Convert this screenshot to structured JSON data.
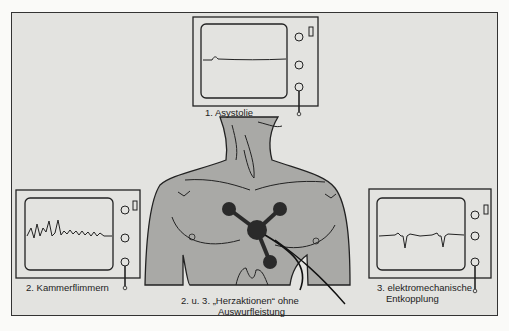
{
  "diagram": {
    "colors": {
      "background": "#e3e3e0",
      "outline": "#222222",
      "body_fill": "#a9a9a6",
      "electrode": "#2a2a2a"
    },
    "monitors": [
      {
        "id": "asystolie",
        "label": "1. Asystolie",
        "trace": "flat-line"
      },
      {
        "id": "kammerflimmern",
        "label": "2. Kammerflimmern",
        "trace": "ventricular-fibrillation"
      },
      {
        "id": "entkopplung",
        "label_line1": "3. elektromechanische",
        "label_line2": "Entkopplung",
        "trace": "qrs-spikes"
      }
    ],
    "center": {
      "label_line1": "2. u. 3. „Herzaktionen“ ohne",
      "label_line2": "Auswurfleistung"
    },
    "electrodes": 4
  }
}
